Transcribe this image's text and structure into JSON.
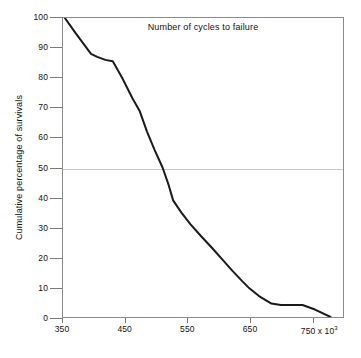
{
  "chart_data": {
    "type": "line",
    "title": "",
    "xlabel": "Number of cycles to failure",
    "ylabel": "Cumulative percentage  of survivals",
    "x_units_note": "x 10",
    "x_units_exponent": "3",
    "xlim": [
      350,
      800
    ],
    "ylim": [
      0,
      100
    ],
    "xticks": [
      350,
      450,
      550,
      650,
      750
    ],
    "xtick_labels": [
      "350",
      "450",
      "550",
      "650",
      "750"
    ],
    "last_xtick_suffix": " x 10",
    "yticks": [
      0,
      10,
      20,
      30,
      40,
      50,
      60,
      70,
      80,
      90,
      100
    ],
    "ytick_labels": [
      "0",
      "10",
      "20",
      "30",
      "40",
      "50",
      "60",
      "70",
      "80",
      "90",
      "100"
    ],
    "grid": "single horizontal gridline at y = 50",
    "gridlines_y": [
      50
    ],
    "legend": "none",
    "series": [
      {
        "name": "Cumulative percentage of survivals",
        "color": "#1a1a1a",
        "line_width": 2,
        "x": [
          353,
          370,
          395,
          405,
          418,
          430,
          445,
          462,
          473,
          485,
          497,
          510,
          520,
          527,
          540,
          555,
          572,
          590,
          607,
          622,
          638,
          650,
          665,
          685,
          700,
          715,
          735,
          755,
          780
        ],
        "y": [
          100,
          95,
          88,
          87,
          86,
          85.5,
          80,
          73,
          69,
          62,
          56,
          50,
          44,
          39,
          35,
          31,
          27,
          23,
          19,
          15.5,
          12,
          9.5,
          7,
          4.5,
          4,
          4,
          4,
          2.5,
          0
        ]
      }
    ],
    "annotations": []
  },
  "axes": {
    "x_tick_suffix_label": "750 x 10",
    "x_tick_suffix_exponent": "3"
  }
}
